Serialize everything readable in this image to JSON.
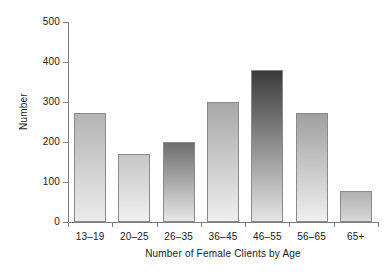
{
  "chart_data": {
    "type": "bar",
    "title": "",
    "xlabel": "Number of Female Clients by Age",
    "ylabel": "Number",
    "categories": [
      "13–19",
      "20–25",
      "26–35",
      "36–45",
      "46–55",
      "56–65",
      "65+"
    ],
    "values": [
      272,
      170,
      200,
      300,
      380,
      272,
      78
    ],
    "ylim": [
      0,
      500
    ],
    "yticks": [
      0,
      100,
      200,
      300,
      400,
      500
    ],
    "ytick_labels": [
      "0",
      "100",
      "200",
      "300",
      "400",
      "500"
    ],
    "grid": false,
    "legend": null,
    "bar_styles": [
      {
        "top": "#b4b4b4",
        "bottom": "#ebebeb"
      },
      {
        "top": "#c6c6c6",
        "bottom": "#f0f0f0"
      },
      {
        "top": "#6e6e6e",
        "bottom": "#e6e6e6"
      },
      {
        "top": "#a8a8a8",
        "bottom": "#eeeeee"
      },
      {
        "top": "#3a3a3a",
        "bottom": "#e4e4e4"
      },
      {
        "top": "#a0a0a0",
        "bottom": "#f0f0f0"
      },
      {
        "top": "#b0b0b0",
        "bottom": "#d8d8d8"
      }
    ],
    "colors": {
      "axis": "#7d7d7d",
      "bar_border": "#8a8a8a",
      "text": "#1a1a1a",
      "background": "#ffffff"
    }
  }
}
